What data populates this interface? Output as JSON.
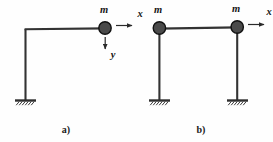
{
  "figure": {
    "background_color": "#fefefe",
    "line_color": "#333333",
    "mass_fill_color": "#4a4a4a",
    "mass_stroke_color": "#111111",
    "label_color": "#151515",
    "hatch_color": "#3a3a3a"
  },
  "panel_a": {
    "caption": "a)",
    "mass_label": "m",
    "axis_x_label": "x",
    "axis_y_label": "y",
    "support_count": 1,
    "mass_count": 1,
    "description": "cantilever L-frame with single lumped mass at beam end"
  },
  "panel_b": {
    "caption": "b)",
    "mass_label_left": "m",
    "mass_label_right": "m",
    "axis_x_label": "x",
    "support_count": 2,
    "mass_count": 2,
    "description": "portal frame with two lumped masses at beam ends"
  },
  "geometry": {
    "panel_a": {
      "column_x": 25,
      "beam_y": 29,
      "base_y": 100,
      "beam_end_x": 105,
      "mass_cx": 105,
      "mass_cy": 28,
      "mass_r": 6.2,
      "support_cx": 25,
      "arrow_x_from": 116,
      "arrow_x_to": 134,
      "arrow_y_from": 105,
      "arrow_y_to": 47,
      "label_m_x": 104,
      "label_m_y": 13,
      "label_x_x": 140,
      "label_x_y": 16,
      "label_y_x": 111,
      "label_y_y": 57,
      "caption_x": 66,
      "caption_y": 132
    },
    "panel_b": {
      "column_left_x": 159,
      "column_right_x": 237,
      "beam_y": 28,
      "base_y": 100,
      "mass_left_cx": 159,
      "mass_left_cy": 28,
      "mass_right_cx": 237,
      "mass_right_cy": 27,
      "mass_r": 6.2,
      "arrow_x_from": 248,
      "arrow_x_to": 266,
      "label_m_left_x": 158,
      "label_m_left_y": 13,
      "label_m_right_x": 236,
      "label_m_right_y": 12,
      "label_x_x": 271,
      "label_x_y": 14,
      "caption_x": 201,
      "caption_y": 132
    }
  }
}
